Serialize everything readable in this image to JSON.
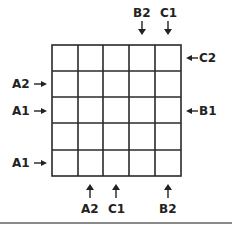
{
  "diagram": {
    "grid": {
      "rows": 5,
      "cols": 5
    },
    "top_labels": [
      {
        "text": "B2",
        "col": 4
      },
      {
        "text": "C1",
        "col": 5
      }
    ],
    "right_labels": [
      {
        "text": "C2",
        "row": 1
      },
      {
        "text": "B1",
        "row": 3
      }
    ],
    "left_labels": [
      {
        "text": "A2",
        "row": 2
      },
      {
        "text": "A1",
        "row": 3
      },
      {
        "text": "A1",
        "row": 5
      }
    ],
    "bottom_labels": [
      {
        "text": "A2",
        "col": 2
      },
      {
        "text": "C1",
        "col": 3
      },
      {
        "text": "B2",
        "col": 5
      }
    ],
    "colors": {
      "line": "#2a2a2a",
      "rule": "#8a8a8a"
    }
  }
}
